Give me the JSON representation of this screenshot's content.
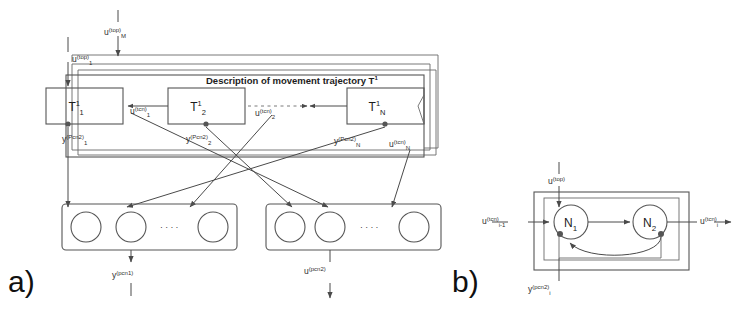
{
  "figure": {
    "panel_a_label": "a)",
    "panel_b_label": "b)"
  },
  "panel_a": {
    "container_title": "Description of movement trajectory T",
    "container_title_sup": "1",
    "top_inputs": [
      {
        "name": "u",
        "sup": "(top)",
        "sub": "1"
      },
      {
        "name": "u",
        "sup": "(top)",
        "sub": "M"
      }
    ],
    "trajectory_blocks": [
      {
        "name": "T",
        "sup": "1",
        "sub": "1"
      },
      {
        "name": "T",
        "sup": "1",
        "sub": "2"
      },
      {
        "name": "T",
        "sup": "1",
        "sub": "N"
      }
    ],
    "interblock_signals": [
      {
        "name": "u",
        "sup": "(tcn)",
        "sub": "1"
      },
      {
        "name": "u",
        "sup": "(tcn)",
        "sub": "2"
      },
      {
        "name": "u",
        "sup": "(tcn)",
        "sub": "N"
      }
    ],
    "block_outputs": [
      {
        "name": "y",
        "sup": "(Pcn2)",
        "sub": "1"
      },
      {
        "name": "y",
        "sup": "(Pcn2)",
        "sub": "2"
      },
      {
        "name": "y",
        "sup": "(Pcn2)",
        "sub": "N"
      }
    ],
    "ellipsis_symbol": "· · · ·",
    "neuron_layers": [
      {
        "id": "left-layer",
        "neuron_count": 3,
        "signal": {
          "name": "y",
          "sup": "(pcn1)",
          "sub": ""
        }
      },
      {
        "id": "right-layer",
        "neuron_count": 3,
        "signal": {
          "name": "u",
          "sup": "(pcn2)",
          "sub": ""
        }
      }
    ]
  },
  "panel_b": {
    "top_input": {
      "name": "u",
      "sup": "(top)",
      "sub": ""
    },
    "left_input": {
      "name": "u",
      "sup": "(tcn)",
      "sub": "i-1"
    },
    "right_output": {
      "name": "u",
      "sup": "(tcn)",
      "sub": "i"
    },
    "bottom_output": {
      "name": "y",
      "sup": "(pcn2)",
      "sub": "i"
    },
    "neurons": [
      {
        "name": "N",
        "sub": "1"
      },
      {
        "name": "N",
        "sub": "2"
      }
    ]
  },
  "colors": {
    "line": "#4a4a4a",
    "box": "#555555",
    "text": "#1c1c1c",
    "background": "#ffffff"
  }
}
